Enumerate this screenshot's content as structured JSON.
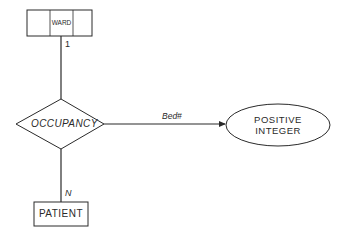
{
  "diagram": {
    "type": "entity-relationship",
    "entities": [
      {
        "id": "ward",
        "label": "WARD",
        "style": "weak-split-box"
      },
      {
        "id": "patient",
        "label": "PATIENT",
        "style": "box"
      }
    ],
    "relationship": {
      "id": "occupancy",
      "label": "OCCUPANCY"
    },
    "value_set": {
      "id": "positive-integer",
      "line1": "POSITIVE",
      "line2": "INTEGER"
    },
    "attribute_arrow": {
      "label": "Bed#"
    },
    "cardinalities": {
      "ward_side": "1",
      "patient_side": "N"
    },
    "colors": {
      "stroke": "#2a2a2a",
      "background": "#ffffff"
    }
  }
}
